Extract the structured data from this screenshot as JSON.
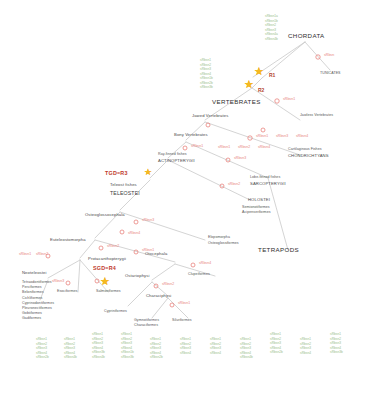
{
  "diagram": {
    "type": "phylogenetic-tree",
    "title_visible": false,
    "colors": {
      "branch": "#c9c9c9",
      "gene_present": "#9ac08a",
      "gene_loss": "#e8837d",
      "wgd_star": "#f5b921",
      "wgd_label": "#c0392b",
      "clade_label": "#3d3d3d"
    }
  },
  "wgd_events": [
    {
      "id": "r1",
      "label": "R1"
    },
    {
      "id": "r2",
      "label": "R2"
    },
    {
      "id": "tgd",
      "label": "TGD=R3"
    },
    {
      "id": "sgd",
      "label": "SGD=R4"
    }
  ],
  "clades": {
    "chordata": "CHORDATA",
    "tunicates": "TUNICATES",
    "vertebrates": "VERTEBRATES",
    "jawless_vertebrates": "Jawless Vertebrates",
    "jawed_vertebrates": "Jawed Vertebrates",
    "cartilaginous_common": "Cartilaginous Fishes",
    "cartilaginous_sci": "CHONDRICHTYANS",
    "bony_vertebrates": "Bony Vertebrates",
    "lobe_finned_common": "Lobe-finned fishes",
    "lobe_finned_sci": "SARCOPTERYGII",
    "tetrapods": "TETRAPODS",
    "ray_finned_common": "Ray-finned fishes",
    "ray_finned_sci": "ACTINOPTERYGII",
    "holostei": "HOLOSTEI",
    "holostei_orders_1": "Semionotiformes",
    "holostei_orders_2": "Acipenseriformes",
    "teleost_common": "Teleost fishes",
    "teleost_sci": "TELEOSTEI",
    "osteoglossocephala": "Osteoglossocephala",
    "elopomorpha": "Elopomorpha",
    "osteoglossiformes": "Osteoglossiformes",
    "euteleostomorpha": "Euteleostomorpha",
    "otocephala": "Otocephala",
    "protacanthopterygii": "Protacanthopterygii",
    "clupeiformes": "Clupeiformes",
    "ostariophysi": "Ostariophysi",
    "characiphysi": "Characiphysi",
    "cypriniformes": "Cypriniformes",
    "gymnotiformes": "Gymnotiformes",
    "characiformes": "Characiformes",
    "siluriformes": "Siluriformes",
    "esociformes": "Esociformes",
    "salmoniformes": "Salmoniformes",
    "neoteleostei": "Neoteleostei"
  },
  "neoteleost_orders": [
    "Tetraodontiformes",
    "Perciformes",
    "Beloniformes",
    "Cichliformes",
    "Cyprinodontiformes",
    "Pleuronectiformes",
    "Gobiiformes",
    "Gadiformes"
  ],
  "gene_loss_labels": [
    {
      "id": "loss-tunicate",
      "text": "sRbsn"
    },
    {
      "id": "loss-jawless",
      "text": "sRbsn1"
    },
    {
      "id": "loss-chondr-1",
      "text": "sRbsn1"
    },
    {
      "id": "loss-chondr-2",
      "text": "sRbsn3"
    },
    {
      "id": "loss-chondr-3",
      "text": "sRbsn4"
    },
    {
      "id": "loss-bony-1",
      "text": "sRbsn1"
    },
    {
      "id": "loss-bony-2",
      "text": "sRbsn2"
    },
    {
      "id": "loss-bony-3",
      "text": "sRbsn4"
    },
    {
      "id": "loss-sarco",
      "text": "sRbsn3"
    },
    {
      "id": "loss-actino",
      "text": "sRbsn1"
    },
    {
      "id": "loss-holostei",
      "text": "sRbsn2"
    },
    {
      "id": "loss-teleost",
      "text": "sRbsn4"
    },
    {
      "id": "loss-osteo",
      "text": "sRbsn3"
    },
    {
      "id": "loss-eutel",
      "text": "sRbsn2"
    },
    {
      "id": "loss-otoceph",
      "text": "sRbsn1"
    },
    {
      "id": "loss-proto-1",
      "text": "sRbsn1"
    },
    {
      "id": "loss-proto-2",
      "text": "sRbsn2"
    },
    {
      "id": "loss-neotel",
      "text": "sRbsn3"
    },
    {
      "id": "loss-clupei",
      "text": "sRbsn4"
    },
    {
      "id": "loss-ostario",
      "text": "sRbsn2"
    },
    {
      "id": "loss-characi",
      "text": "sRbsn1"
    },
    {
      "id": "loss-salmon",
      "text": "sRbsn3"
    }
  ],
  "gene_columns": [
    {
      "id": "col-chordata-top",
      "x": 265,
      "y": 14,
      "genes": [
        "sRbsn1a",
        "sRbsn1b",
        "sRbsn2",
        "sRbsn3",
        "sRbsn4a",
        "sRbsn4b"
      ]
    },
    {
      "id": "col-vertebrates",
      "x": 200,
      "y": 58,
      "genes": [
        "sRbsn1",
        "sRbsn2",
        "sRbsn3",
        "sRbsn4",
        "sRbsn1b",
        "sRbsn2b",
        "sRbsn3b"
      ]
    },
    {
      "id": "col-leaf-1",
      "x": 36,
      "y": 337,
      "genes": [
        "sRbsn1",
        "sRbsn2",
        "sRbsn3",
        "sRbsn4",
        "sRbsn2b"
      ]
    },
    {
      "id": "col-leaf-2",
      "x": 64,
      "y": 337,
      "genes": [
        "sRbsn1",
        "sRbsn2",
        "sRbsn3",
        "sRbsn4",
        "sRbsn4b"
      ]
    },
    {
      "id": "col-leaf-3",
      "x": 92,
      "y": 332,
      "genes": [
        "sRbsn1",
        "sRbsn2",
        "sRbsn3",
        "sRbsn4",
        "sRbsn3b",
        "sRbsn4b"
      ]
    },
    {
      "id": "col-leaf-4",
      "x": 121,
      "y": 332,
      "genes": [
        "sRbsn1",
        "sRbsn2",
        "sRbsn3",
        "sRbsn4",
        "sRbsn1b",
        "sRbsn3b"
      ]
    },
    {
      "id": "col-leaf-5",
      "x": 150,
      "y": 337,
      "genes": [
        "sRbsn1",
        "sRbsn2",
        "sRbsn3",
        "sRbsn4",
        "sRbsn2b"
      ]
    },
    {
      "id": "col-leaf-6",
      "x": 180,
      "y": 337,
      "genes": [
        "sRbsn1",
        "sRbsn2",
        "sRbsn3",
        "sRbsn4"
      ]
    },
    {
      "id": "col-leaf-7",
      "x": 210,
      "y": 337,
      "genes": [
        "sRbsn1",
        "sRbsn2",
        "sRbsn3",
        "sRbsn4"
      ]
    },
    {
      "id": "col-leaf-8",
      "x": 240,
      "y": 337,
      "genes": [
        "sRbsn1",
        "sRbsn2",
        "sRbsn3",
        "sRbsn4",
        "sRbsn4b"
      ]
    },
    {
      "id": "col-leaf-9",
      "x": 270,
      "y": 332,
      "genes": [
        "sRbsn1",
        "sRbsn2",
        "sRbsn3",
        "sRbsn4",
        "sRbsn2b"
      ]
    },
    {
      "id": "col-leaf-10",
      "x": 300,
      "y": 337,
      "genes": [
        "sRbsn1",
        "sRbsn2",
        "sRbsn3",
        "sRbsn4"
      ]
    },
    {
      "id": "col-leaf-11",
      "x": 330,
      "y": 332,
      "genes": [
        "sRbsn1",
        "sRbsn2",
        "sRbsn3",
        "sRbsn4",
        "sRbsn3b"
      ]
    }
  ]
}
